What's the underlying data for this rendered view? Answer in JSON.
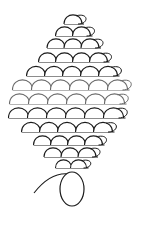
{
  "diagram": {
    "type": "beadwork-pattern",
    "stroke_dark": "#1a1a1a",
    "stroke_gray": "#6a6a6a",
    "background": "#ffffff",
    "rows": [
      {
        "y": 24,
        "count": 1,
        "cx": 73,
        "r": 9,
        "tone": "dark"
      },
      {
        "y": 36,
        "count": 2,
        "cx": 73,
        "r": 9,
        "tone": "dark"
      },
      {
        "y": 48,
        "count": 3,
        "cx": 73,
        "r": 9,
        "tone": "dark"
      },
      {
        "y": 62,
        "count": 4,
        "cx": 73,
        "r": 9,
        "tone": "dark"
      },
      {
        "y": 76,
        "count": 5,
        "cx": 72,
        "r": 9.5,
        "tone": "dark"
      },
      {
        "y": 90,
        "count": 6,
        "cx": 70,
        "r": 10,
        "tone": "gray"
      },
      {
        "y": 104,
        "count": 6,
        "cx": 67,
        "r": 10,
        "tone": "gray"
      },
      {
        "y": 118,
        "count": 6,
        "cx": 66,
        "r": 10,
        "tone": "dark"
      },
      {
        "y": 132,
        "count": 5,
        "cx": 67,
        "r": 9.5,
        "tone": "dark"
      },
      {
        "y": 145,
        "count": 4,
        "cx": 68,
        "r": 9,
        "tone": "dark"
      },
      {
        "y": 157,
        "count": 3,
        "cx": 70,
        "r": 9,
        "tone": "dark"
      },
      {
        "y": 168,
        "count": 2,
        "cx": 71,
        "r": 8,
        "tone": "dark"
      }
    ],
    "thread": {
      "d": "M34 193 C44 180, 56 172, 70 174"
    },
    "end_bead": {
      "cx": 72,
      "cy": 189,
      "rx": 12,
      "ry": 17
    }
  }
}
